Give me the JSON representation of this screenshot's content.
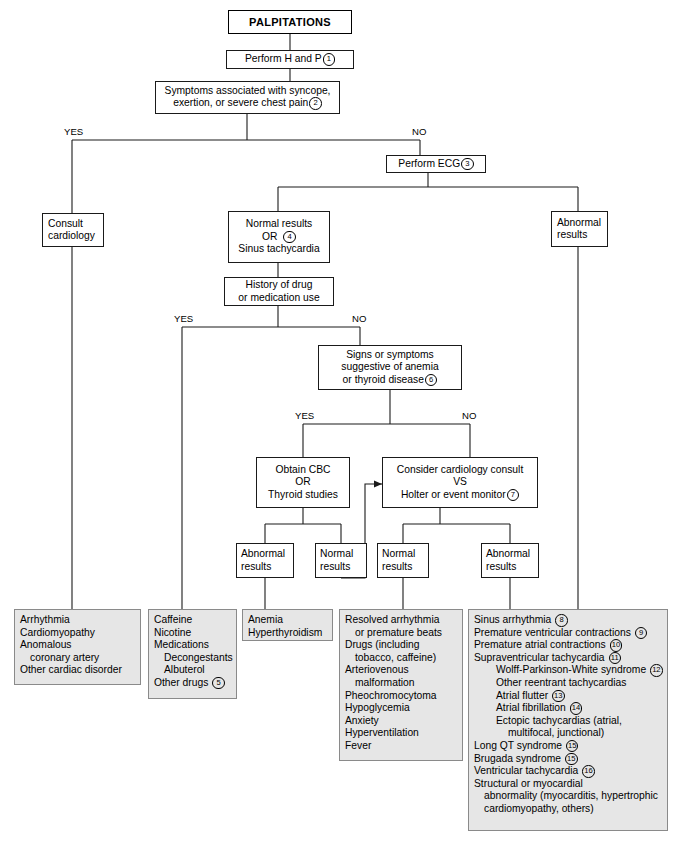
{
  "diagram": {
    "title": "PALPITATIONS",
    "type": "clinical-algorithm-flowchart"
  },
  "nodes": {
    "title": "PALPITATIONS",
    "perform_h_and_p": "Perform H and P",
    "perform_h_and_p_ref": "1",
    "symptoms_line1": "Symptoms associated with syncope,",
    "symptoms_line2": "exertion, or severe chest pain",
    "symptoms_ref": "2",
    "perform_ecg": "Perform ECG",
    "perform_ecg_ref": "3",
    "consult_cardiology_line1": "Consult",
    "consult_cardiology_line2": "cardiology",
    "normal_results_line1": "Normal results",
    "normal_results_line2": "OR",
    "normal_results_ref": "4",
    "normal_results_line3": "Sinus tachycardia",
    "abnormal_ecg_line1": "Abnormal",
    "abnormal_ecg_line2": "results",
    "history_drug_line1": "History of drug",
    "history_drug_line2": "or medication use",
    "signs_anemia_line1": "Signs or symptoms",
    "signs_anemia_line2": "suggestive of anemia",
    "signs_anemia_line3": "or thyroid disease",
    "signs_anemia_ref": "6",
    "obtain_cbc_line1": "Obtain CBC",
    "obtain_cbc_line2": "OR",
    "obtain_cbc_line3": "Thyroid studies",
    "consider_consult_line1": "Consider cardiology consult",
    "consider_consult_line2": "VS",
    "consider_consult_line3": "Holter or event monitor",
    "consider_consult_ref": "7",
    "cbc_abnormal_line1": "Abnormal",
    "cbc_abnormal_line2": "results",
    "cbc_normal_line1": "Normal",
    "cbc_normal_line2": "results",
    "monitor_normal_line1": "Normal",
    "monitor_normal_line2": "results",
    "monitor_abnormal_line1": "Abnormal",
    "monitor_abnormal_line2": "results"
  },
  "branch_labels": {
    "symptoms_yes": "YES",
    "symptoms_no": "NO",
    "drug_yes": "YES",
    "drug_no": "NO",
    "anemia_yes": "YES",
    "anemia_no": "NO"
  },
  "outcomes": {
    "cardiac": {
      "lines": [
        "Arrhythmia",
        "Cardiomyopathy",
        "Anomalous",
        "coronary artery",
        "Other cardiac disorder"
      ],
      "indents": [
        0,
        0,
        0,
        1,
        0
      ]
    },
    "drugs": {
      "lines": [
        "Caffeine",
        "Nicotine",
        "Medications",
        "Decongestants",
        "Albuterol",
        "Other drugs"
      ],
      "indents": [
        0,
        0,
        0,
        1,
        1,
        0
      ],
      "refs": [
        null,
        null,
        null,
        null,
        null,
        "5"
      ]
    },
    "anemia_thyroid": {
      "lines": [
        "Anemia",
        "Hyperthyroidism"
      ],
      "indents": [
        0,
        0
      ]
    },
    "benign": {
      "lines": [
        "Resolved arrhythmia",
        "or premature beats",
        "Drugs (including",
        "tobacco, caffeine)",
        "Arteriovenous",
        "malformation",
        "Pheochromocytoma",
        "Hypoglycemia",
        "Anxiety",
        "Hyperventilation",
        "Fever"
      ],
      "indents": [
        0,
        1,
        0,
        1,
        0,
        1,
        0,
        0,
        0,
        0,
        0
      ]
    },
    "arrhythmias": {
      "lines": [
        "Sinus arrhythmia",
        "Premature ventricular contractions",
        "Premature atrial contractions",
        "Supraventricular tachycardia",
        "Wolff-Parkinson-White syndrome",
        "Other reentrant tachycardias",
        "Atrial flutter",
        "Atrial fibrillation",
        "Ectopic tachycardias (atrial,",
        "multifocal, junctional)",
        "Long QT syndrome",
        "Brugada syndrome",
        "Ventricular tachycardia",
        "Structural or myocardial",
        "abnormality (myocarditis, hypertrophic",
        "cardiomyopathy, others)"
      ],
      "indents": [
        0,
        0,
        0,
        0,
        2,
        2,
        2,
        2,
        2,
        3,
        0,
        0,
        0,
        0,
        1,
        1
      ],
      "refs": [
        "8",
        "9",
        "10",
        "11",
        "12",
        null,
        "13",
        "14",
        null,
        null,
        "15",
        "15",
        "16",
        null,
        null,
        null
      ]
    }
  },
  "colors": {
    "line": "#1a1a1a",
    "box_border": "#1a1a1a",
    "outcome_fill": "#e6e6e6",
    "outcome_border": "#8a8a8a",
    "text": "#000000",
    "background": "#ffffff"
  }
}
